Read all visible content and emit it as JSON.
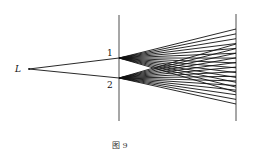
{
  "diagram": {
    "source_label": "L",
    "slit_labels": [
      "1",
      "2"
    ],
    "caption": "图 9",
    "ray_count_per_slit": 14,
    "colors": {
      "ink": "#111111",
      "background": "#ffffff"
    }
  }
}
